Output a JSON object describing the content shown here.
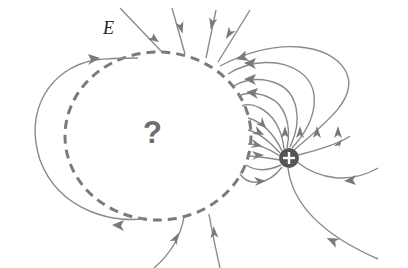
{
  "diagram": {
    "field_label": "E",
    "unknown_region_label": "?",
    "charge": {
      "sign": "+",
      "color": "#555555",
      "glyph": "+"
    },
    "colors": {
      "background": "#ffffff",
      "field_lines": "#8a8a8a",
      "boundary_dashed": "#7a7a7a",
      "question_mark": "#6d6d6d",
      "label_text": "#222222"
    },
    "elements": [
      "dashed circular boundary enclosing unknown region",
      "positive point charge outside boundary on lower right",
      "electric field lines emanating from positive charge",
      "field lines entering boundary from top",
      "field line arcing around left side of boundary",
      "field lines exiting boundary at bottom"
    ]
  }
}
